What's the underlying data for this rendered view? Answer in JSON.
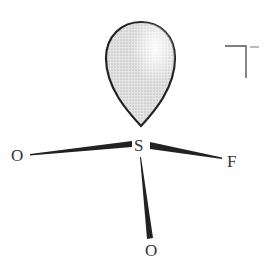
{
  "diagram": {
    "central_atom": {
      "label": "S"
    },
    "ligands": [
      {
        "label": "O",
        "position": "left"
      },
      {
        "label": "F",
        "position": "right"
      },
      {
        "label": "O",
        "position": "bottom"
      }
    ],
    "lone_pair": {
      "shape": "teardrop-lobe",
      "position": "top"
    },
    "corner_mark": {
      "symbol": "T-shaped mark"
    },
    "colors": {
      "line": "#222222",
      "lobe_fill": "#d9d9d9",
      "text": "#333333"
    }
  }
}
